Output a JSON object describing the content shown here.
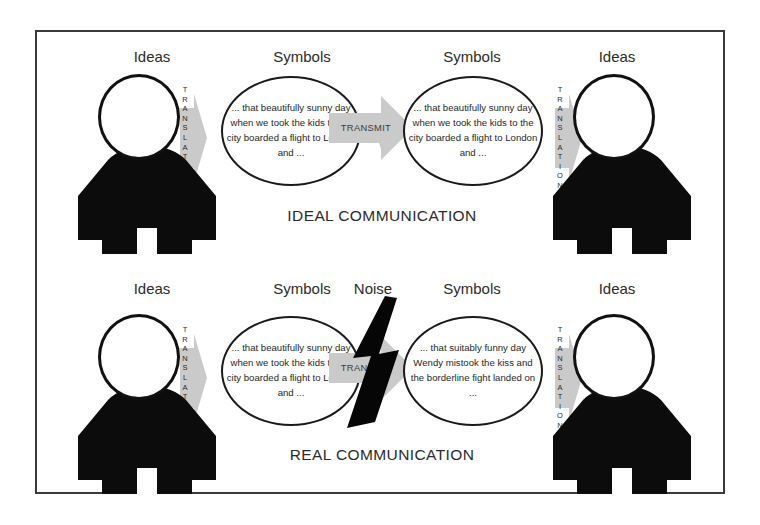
{
  "diagram": {
    "colors": {
      "ink": "#111111",
      "frame": "#3a3a3a",
      "arrow_gray": "#c9c9c9",
      "arrow_gray_dark": "#b3b3b3",
      "text": "#2b2b2b",
      "background": "#ffffff"
    },
    "rows": [
      {
        "id": "ideal",
        "caption": "IDEAL COMMUNICATION",
        "labels": {
          "sender_ideas": "Ideas",
          "sender_symbols": "Symbols",
          "receiver_symbols": "Symbols",
          "receiver_ideas": "Ideas"
        },
        "sender_translation": "TRANSLATION",
        "receiver_translation": "TRANSLATION",
        "transmit_label": "TRANSMIT",
        "noise_label": "",
        "sender_bubble": "... that beautifully sunny day when we took the kids to the city boarded a flight to London and ...",
        "receiver_bubble": "... that beautifully sunny day when we took the kids to the city boarded a flight to London and ...",
        "sender_head_icons": [
          "sun-icon",
          "adult-figure-icon",
          "child-figure-icon",
          "city-skyline-icon",
          "airplane-icon"
        ],
        "receiver_head_icons": [
          "sun-icon",
          "adult-figure-icon",
          "child-figure-icon",
          "city-skyline-icon",
          "airplane-icon"
        ],
        "has_noise": false
      },
      {
        "id": "real",
        "caption": "REAL COMMUNICATION",
        "labels": {
          "sender_ideas": "Ideas",
          "sender_symbols": "Symbols",
          "noise": "Noise",
          "receiver_symbols": "Symbols",
          "receiver_ideas": "Ideas"
        },
        "sender_translation": "TRANSLATION",
        "receiver_translation": "TRANSLATION",
        "transmit_label": "TRANSMIT",
        "noise_label": "Noise",
        "sender_bubble": "... that beautifully sunny day when we took the kids to the city boarded a flight to London and ...",
        "receiver_bubble": "... that suitably funny day Wendy mistook the kiss and the borderline fight landed on ...",
        "sender_head_icons": [
          "sun-icon",
          "adult-figure-icon",
          "child-figure-icon",
          "city-skyline-icon",
          "airplane-icon"
        ],
        "receiver_head_icons": [
          "rain-cloud-icon",
          "lips-icon",
          "question-mark-icon",
          "standing-figure-icon"
        ],
        "has_noise": true,
        "noise_icon": "lightning-bolt-icon"
      }
    ]
  }
}
